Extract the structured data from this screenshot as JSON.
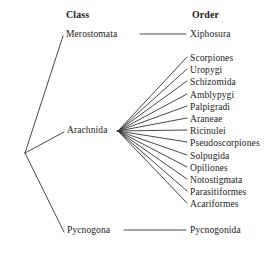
{
  "figure": {
    "type": "cladogram",
    "background": "#ffffff",
    "line_color": "#333333",
    "headers": {
      "class": "Class",
      "order": "Order"
    }
  },
  "classes": [
    {
      "id": "merostomata",
      "label": "Merostomata",
      "x": 66,
      "y": 35
    },
    {
      "id": "arachnida",
      "label": "Arachnida",
      "x": 67,
      "y": 131
    },
    {
      "id": "pycnogona",
      "label": "Pycnogona",
      "x": 67,
      "y": 231
    }
  ],
  "orders": [
    {
      "label": "Xiphosura",
      "parent": "merostomata",
      "y": 35
    },
    {
      "label": "Scorpiones",
      "parent": "arachnida",
      "y": 59
    },
    {
      "label": "Uropygi",
      "parent": "arachnida",
      "y": 71
    },
    {
      "label": "Schizomida",
      "parent": "arachnida",
      "y": 83
    },
    {
      "label": "Amblypygi",
      "parent": "arachnida",
      "y": 96
    },
    {
      "label": "Palpigradi",
      "parent": "arachnida",
      "y": 108
    },
    {
      "label": "Araneae",
      "parent": "arachnida",
      "y": 120
    },
    {
      "label": "Ricinulei",
      "parent": "arachnida",
      "y": 132
    },
    {
      "label": "Pseudoscorpiones",
      "parent": "arachnida",
      "y": 144
    },
    {
      "label": "Solpugida",
      "parent": "arachnida",
      "y": 157
    },
    {
      "label": "Opiliones",
      "parent": "arachnida",
      "y": 169
    },
    {
      "label": "Notostigmata",
      "parent": "arachnida",
      "y": 181
    },
    {
      "label": "Parasitiformes",
      "parent": "arachnida",
      "y": 193
    },
    {
      "label": "Acariformes",
      "parent": "arachnida",
      "y": 205
    },
    {
      "label": "Pycnogonida",
      "parent": "pycnogona",
      "y": 231
    }
  ],
  "nodes": {
    "root": {
      "x": 25,
      "y": 153
    },
    "arachnida_fan": {
      "x": 118,
      "y": 131
    }
  }
}
